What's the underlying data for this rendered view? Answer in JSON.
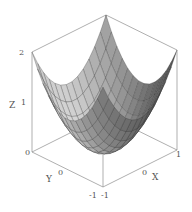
{
  "chart_data": {
    "type": "surface3d",
    "title": "",
    "function": "z = x^2 + y^2",
    "xlabel": "X",
    "ylabel": "Y",
    "zlabel": "Z",
    "xlim": [
      -1,
      1
    ],
    "ylim": [
      -1,
      1
    ],
    "zlim": [
      0,
      2
    ],
    "x_ticks": [
      "-1",
      "0",
      "1"
    ],
    "y_ticks": [
      "-1",
      "0",
      "1"
    ],
    "z_ticks": [
      "0",
      "1",
      "2"
    ],
    "grid_resolution": 13,
    "box": true,
    "colors": {
      "surface_light": "#d6d6d6",
      "surface_dark": "#3a3a3a",
      "mesh": "#333333",
      "box": "#8c8c8c"
    }
  },
  "labels": {
    "z_axis": "Z",
    "z_tick_2": "2",
    "z_tick_1": "1",
    "z_tick_0": "0",
    "y_axis": "Y",
    "y_tick_0": "0",
    "y_tick_m1": "-1",
    "x_axis": "X",
    "x_tick_0": "0",
    "x_tick_m1": "-1",
    "x_tick_1": "1"
  }
}
